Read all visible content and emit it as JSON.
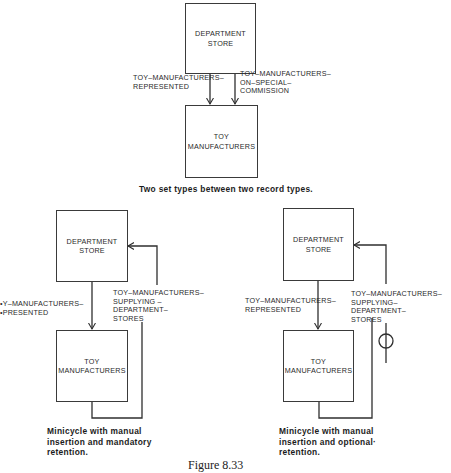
{
  "top_diagram": {
    "owner_box": "DEPARTMENT\nSTORE",
    "member_box": "TOY\nMANUFACTURERS",
    "set_left_label": "TOY–MANUFACTURERS–\nREPRESENTED",
    "set_right_label": "TOY–MANUFACTURERS–\nON–SPECIAL–\nCOMMISSION",
    "caption": "Two set types between two record types."
  },
  "left_diagram": {
    "owner_box": "DEPARTMENT\nSTORE",
    "member_box": "TOY\nMANUFACTURERS",
    "set_label": "•Y–MANUFACTURERS–\n•PRESENTED",
    "cycle_label": "TOY–MANUFACTURERS–\nSUPPLYING –\nDEPARTMENT–\nSTORES",
    "caption": "Minicycle with manual\ninsertion and mandatory\nretention."
  },
  "right_diagram": {
    "owner_box": "DEPARTMENT\nSTORE",
    "member_box": "TOY\nMANUFACTURERS",
    "set_label": "TOY–MANUFACTURERS–\nREPRESENTED",
    "cycle_label": "TOY–MANUFACTURERS–\nSUPPLYING–\nDEPARTMENT–\nSTORES",
    "caption": "Minicycle with manual\ninsertion and optional·\nretention."
  },
  "figure_caption": "Figure 8.33",
  "colors": {
    "line": "#2f2f2f",
    "text": "#2a2a2a",
    "background": "#ffffff"
  }
}
